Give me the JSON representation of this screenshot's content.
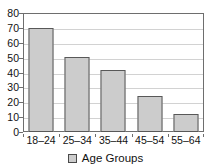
{
  "chart_data": {
    "type": "bar",
    "title": "",
    "xlabel": "",
    "ylabel": "",
    "categories": [
      "18–24",
      "25–34",
      "35–44",
      "45–54",
      "55–64"
    ],
    "values": [
      70,
      50.5,
      41.5,
      24.5,
      12
    ],
    "ylim": [
      0,
      80
    ],
    "yticks": [
      0,
      10,
      20,
      30,
      40,
      50,
      60,
      70,
      80
    ],
    "ytick_labels": [
      "0",
      "10",
      "20",
      "30",
      "40",
      "50",
      "60",
      "70",
      "80"
    ],
    "grid": true,
    "legend": {
      "position": "bottom",
      "entries": [
        {
          "label": "Age Groups",
          "swatch_color": "#cccccc"
        }
      ]
    },
    "colors": {
      "bar_fill": "#cccccc",
      "bar_border": "#585858",
      "gridline": "#d2d2d2",
      "axis": "#6e6e6e",
      "text": "#111111",
      "background": "#ffffff"
    }
  }
}
